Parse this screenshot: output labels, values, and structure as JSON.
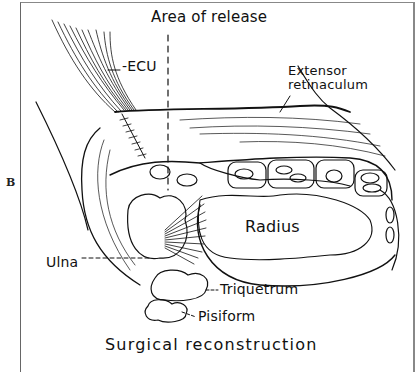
{
  "figure": {
    "panel_letter": "B",
    "caption": "Surgical reconstruction",
    "labels": {
      "area_of_release": "Area of release",
      "ecu": "-ECU",
      "extensor_retinaculum_line1": "Extensor",
      "extensor_retinaculum_line2": "retinaculum",
      "radius": "Radius",
      "ulna": "Ulna",
      "triquetrum": "Triquetrum",
      "pisiform": "Pisiform"
    }
  }
}
